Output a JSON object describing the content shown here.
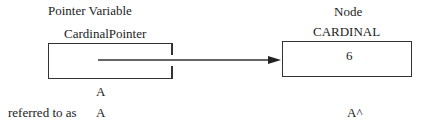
{
  "pointer": {
    "heading": "Pointer Variable",
    "name": "CardinalPointer",
    "label": "A"
  },
  "node": {
    "heading": "Node",
    "type": "CARDINAL",
    "value": "6"
  },
  "reference": {
    "caption": "referred to as",
    "pointer_ref": "A",
    "node_ref": "A^"
  }
}
